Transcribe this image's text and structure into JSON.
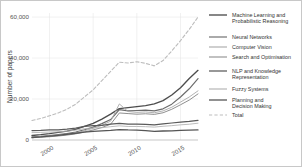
{
  "chart_data": {
    "type": "line",
    "title": "",
    "xlabel": "",
    "ylabel": "Number of papers",
    "xlim": [
      1998,
      2017
    ],
    "ylim": [
      0,
      62000
    ],
    "grid": true,
    "legend_position": "right",
    "x": [
      1998,
      1999,
      2000,
      2001,
      2002,
      2003,
      2004,
      2005,
      2006,
      2007,
      2008,
      2009,
      2010,
      2011,
      2012,
      2013,
      2014,
      2015,
      2016,
      2017
    ],
    "xticks": [
      "2000",
      "2005",
      "2010",
      "2015"
    ],
    "xtick_values": [
      2000,
      2005,
      2010,
      2015
    ],
    "yticks": [
      "0",
      "20,000",
      "40,000",
      "60,000"
    ],
    "ytick_values": [
      0,
      20000,
      40000,
      60000
    ],
    "series": [
      {
        "name": "Machine Learning and Probabilistic Reasoning",
        "color": "#4d4d4d",
        "width": 1.35,
        "dash": "none",
        "values": [
          2200,
          2600,
          3100,
          3700,
          4300,
          5200,
          6600,
          8100,
          10200,
          12600,
          15300,
          15800,
          16300,
          16800,
          17600,
          19200,
          22000,
          25500,
          30000,
          34000
        ]
      },
      {
        "name": "Neural Networks",
        "color": "#6b6b6b",
        "width": 1.15,
        "dash": "none",
        "values": [
          1500,
          1800,
          2200,
          2700,
          3200,
          3900,
          5000,
          6300,
          8000,
          10000,
          14800,
          14200,
          14400,
          14600,
          14200,
          15200,
          17500,
          21000,
          25000,
          30000
        ]
      },
      {
        "name": "Computer Vision",
        "color": "#a8a8a8",
        "width": 0.9,
        "dash": "none",
        "values": [
          1300,
          1600,
          1900,
          2300,
          2800,
          3500,
          4500,
          5700,
          7200,
          9200,
          17600,
          13900,
          13500,
          13700,
          13300,
          14200,
          16000,
          18500,
          21000,
          24000
        ]
      },
      {
        "name": "Search and Optimisation",
        "color": "#8f8f8f",
        "width": 1.0,
        "dash": "none",
        "values": [
          1100,
          1350,
          1600,
          1950,
          2400,
          3000,
          3900,
          4900,
          6100,
          7700,
          13200,
          12900,
          12600,
          12800,
          12500,
          13300,
          15000,
          17200,
          19500,
          22500
        ]
      },
      {
        "name": "NLP and Knowledge Representation",
        "color": "#5a5a5a",
        "width": 1.25,
        "dash": "none",
        "values": [
          4600,
          4700,
          4900,
          5000,
          5300,
          5800,
          6600,
          7000,
          7100,
          7700,
          8100,
          7700,
          7700,
          7600,
          7400,
          7900,
          8300,
          8700,
          9100,
          9600
        ]
      },
      {
        "name": "Fuzzy Systems",
        "color": "#b0b0b0",
        "width": 0.85,
        "dash": "none",
        "values": [
          3600,
          3700,
          3900,
          4000,
          4300,
          4800,
          5500,
          5900,
          6000,
          6500,
          6900,
          6600,
          6600,
          6500,
          6300,
          6700,
          7000,
          7400,
          7700,
          8200
        ]
      },
      {
        "name": "Planning and Decision Making",
        "color": "#555555",
        "width": 1.3,
        "dash": "none",
        "values": [
          1200,
          1500,
          1900,
          2300,
          2800,
          3300,
          3800,
          4200,
          4500,
          4700,
          5100,
          4900,
          4800,
          4600,
          4200,
          4400,
          4500,
          4700,
          4800,
          4900
        ]
      },
      {
        "name": "Total",
        "color": "#bdbdbd",
        "width": 1.1,
        "dash": "3.2,2.2",
        "values": [
          9500,
          10500,
          11800,
          13200,
          15000,
          17500,
          21000,
          24500,
          29000,
          33500,
          38000,
          37600,
          38200,
          37400,
          36200,
          38800,
          43500,
          48500,
          54000,
          60000
        ]
      }
    ]
  },
  "legend": {
    "items": [
      {
        "label": "Machine Learning and Probabilistic Reasoning"
      },
      {
        "label": "Neural Networks"
      },
      {
        "label": "Computer Vision"
      },
      {
        "label": "Search and Optimisation"
      },
      {
        "label": "NLP and Knowledge Representation"
      },
      {
        "label": "Fuzzy Systems"
      },
      {
        "label": "Planning and Decision Making"
      },
      {
        "label": "Total"
      }
    ]
  }
}
